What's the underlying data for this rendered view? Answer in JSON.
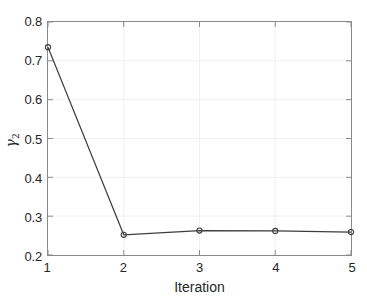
{
  "chart_data": {
    "type": "line",
    "title": "",
    "xlabel": "Iteration",
    "ylabel": "γ₂",
    "ylabel_base": "γ",
    "ylabel_sub": "2",
    "x": [
      1,
      2,
      3,
      4,
      5
    ],
    "values": [
      0.735,
      0.252,
      0.263,
      0.262,
      0.259
    ],
    "series": [
      {
        "name": "gamma2",
        "x": [
          1,
          2,
          3,
          4,
          5
        ],
        "values": [
          0.735,
          0.252,
          0.263,
          0.262,
          0.259
        ]
      }
    ],
    "xlim": [
      1,
      5
    ],
    "ylim": [
      0.2,
      0.8
    ],
    "xticks": [
      1,
      2,
      3,
      4,
      5
    ],
    "yticks": [
      0.2,
      0.3,
      0.4,
      0.5,
      0.6,
      0.7,
      0.8
    ],
    "xtick_labels": [
      "1",
      "2",
      "3",
      "4",
      "5"
    ],
    "ytick_labels": [
      "0.2",
      "0.3",
      "0.4",
      "0.5",
      "0.6",
      "0.7",
      "0.8"
    ],
    "grid": true,
    "legend": null,
    "marker": "circle",
    "line_color": "#3d3d3d",
    "marker_color": "#3d3d3d",
    "axis_color": "#8a8a8a",
    "grid_color": "#f0f0f0",
    "text_color": "#262626",
    "background": "#ffffff"
  }
}
